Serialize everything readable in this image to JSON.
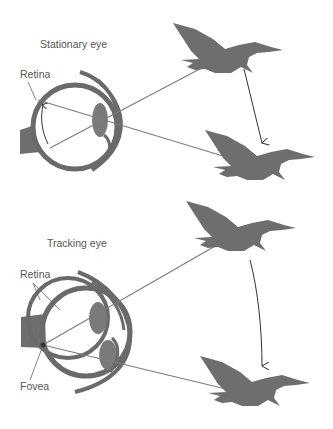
{
  "panels": [
    {
      "title": "Stationary eye",
      "labels": {
        "retina": "Retina"
      }
    },
    {
      "title": "Tracking eye",
      "labels": {
        "retina": "Retina",
        "fovea": "Fovea"
      }
    }
  ],
  "colors": {
    "bird": "#6e6e6e",
    "eye_outline": "#6a6a6a",
    "lens": "#7a7a7a",
    "ray": "#7d7d7d",
    "arrow": "#333333",
    "label": "#555555"
  }
}
